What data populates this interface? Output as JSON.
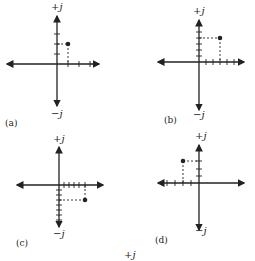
{
  "figure": {
    "panels": [
      {
        "id": "a",
        "caption": "(a)",
        "plus_label": "+j",
        "minus_label": "−j",
        "point": {
          "real": 1,
          "imag": 2
        }
      },
      {
        "id": "b",
        "caption": "(b)",
        "plus_label": "+j",
        "minus_label": "−j",
        "point": {
          "real": 3,
          "imag": 4
        }
      },
      {
        "id": "c",
        "caption": "(c)",
        "plus_label": "+j",
        "minus_label": "−j",
        "point": {
          "real": 5,
          "imag": -3
        }
      },
      {
        "id": "d",
        "caption": "(d)",
        "plus_label": "+j",
        "minus_label": "−j",
        "point": {
          "real": -3,
          "imag": 3
        }
      }
    ],
    "footer_label": "+j"
  }
}
